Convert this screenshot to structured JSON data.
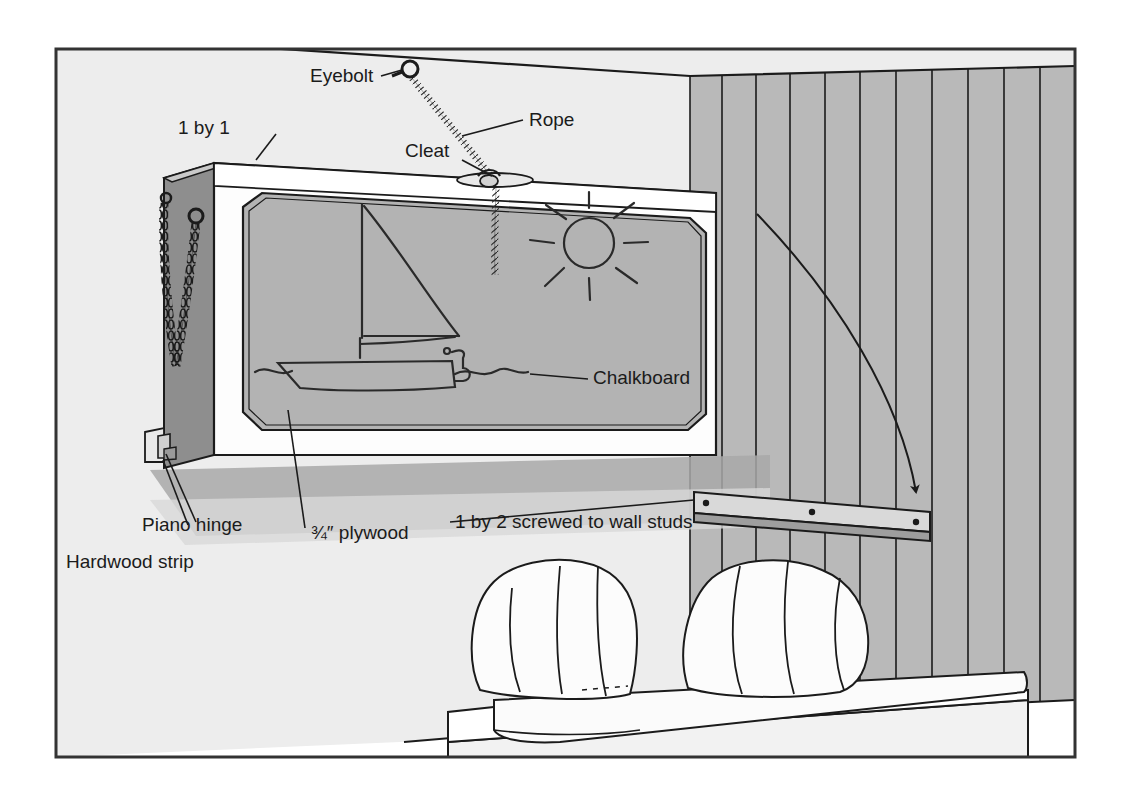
{
  "figure": {
    "border_color": "#333333",
    "page_background": "#ffffff"
  },
  "palette": {
    "wall_light": "#ededed",
    "wall_panel": "#b9b9b9",
    "chalkboard": "#b3b3b3",
    "cabinet_side": "#8e8e8e",
    "frame_white": "#fdfdfd",
    "shadow": "#a8a8a8",
    "floor_light": "#e2e2e2",
    "line": "#1b1b1b",
    "text": "#1b1b1b"
  },
  "labels": [
    {
      "id": "eyebolt",
      "text": "Eyebolt",
      "x": 310,
      "y": 82
    },
    {
      "id": "rope",
      "text": "Rope",
      "x": 529,
      "y": 126
    },
    {
      "id": "one-by-one",
      "text": "1 by 1",
      "x": 178,
      "y": 134
    },
    {
      "id": "cleat",
      "text": "Cleat",
      "x": 405,
      "y": 157
    },
    {
      "id": "chalkboard",
      "text": "Chalkboard",
      "x": 593,
      "y": 384
    },
    {
      "id": "piano-hinge",
      "text": "Piano hinge",
      "x": 142,
      "y": 531
    },
    {
      "id": "plywood",
      "text": "¾″ plywood",
      "x": 311,
      "y": 539
    },
    {
      "id": "hardwood-strip",
      "text": "Hardwood strip",
      "x": 66,
      "y": 568
    },
    {
      "id": "one-by-two",
      "text": "1 by 2 screwed to wall studs",
      "x": 455,
      "y": 528
    }
  ],
  "parts": {
    "cabinet": "fold-down plywood cabinet with white face frame",
    "chalkboard_drawing": "child's chalk drawing of a sailboat on water with sun",
    "chain": "safety chain on cabinet side",
    "cleat_bar": "1 by 2 wall cleat with three screws",
    "sofa": "platform daybed with two striped back cushions",
    "wall": "vertical board-and-batten paneling",
    "arrow": "curved arrow showing cabinet swinging down to wall cleat"
  }
}
